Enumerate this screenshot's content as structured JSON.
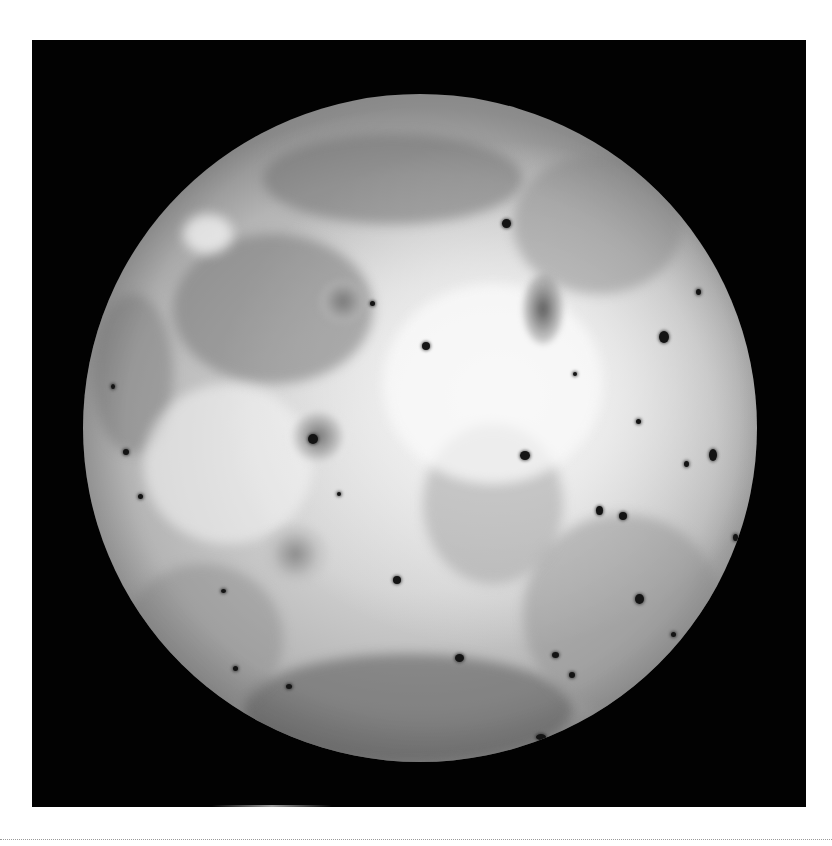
{
  "image": {
    "subject": "Io (moon of Jupiter), full-disc grayscale view",
    "background_color": "#ffffff",
    "frame_color": "#020202",
    "surface_colors": {
      "bright_plains": "#efefef",
      "mid_plains": "#cdcdcd",
      "dark_terrain": "#8a8a8a",
      "volcanic_spots": "#141414"
    }
  },
  "frame": {
    "x": 32,
    "y": 40,
    "width": 774,
    "height": 767
  },
  "moon": {
    "center_x": 420,
    "center_y": 428,
    "radius_x": 337,
    "radius_y": 334
  },
  "separator": {
    "style": "dotted",
    "y": 839
  }
}
